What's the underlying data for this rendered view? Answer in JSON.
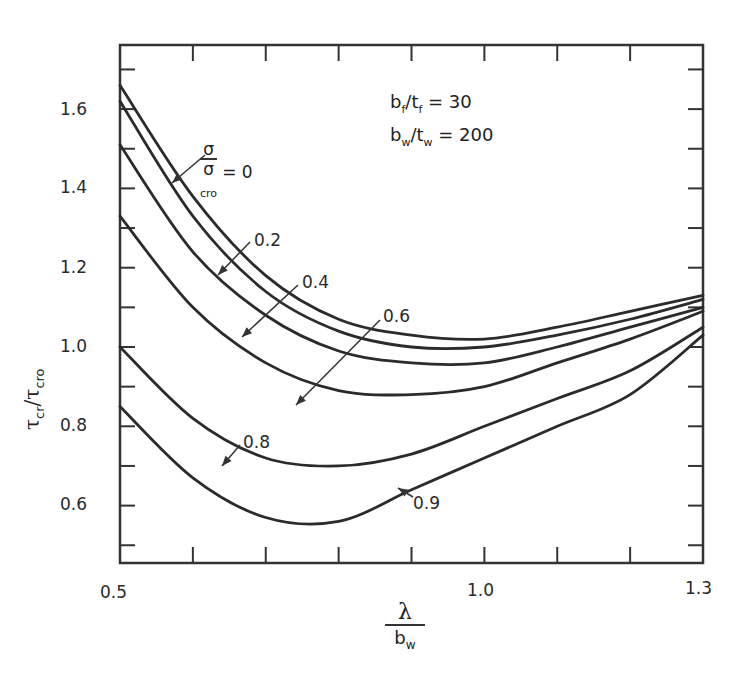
{
  "chart_data": {
    "type": "line",
    "title": "",
    "xlabel": "λ / b_w",
    "ylabel": "τ_cr / τ_cro",
    "xlim": [
      0.5,
      1.3
    ],
    "ylim": [
      0.45,
      1.76
    ],
    "x_ticks": [
      "0.5",
      "1.0",
      "1.3"
    ],
    "y_ticks": [
      "0.6",
      "0.8",
      "1.0",
      "1.2",
      "1.4",
      "1.6"
    ],
    "grid": false,
    "annotations": [
      "b_f/t_f = 30",
      "b_w/t_w = 200"
    ],
    "legend_param": "σ/σ_cro",
    "x": [
      0.5,
      0.6,
      0.7,
      0.8,
      0.9,
      1.0,
      1.1,
      1.2,
      1.3
    ],
    "series": [
      {
        "name": "σ/σcro = 0",
        "values": [
          1.66,
          1.38,
          1.18,
          1.07,
          1.03,
          1.02,
          1.05,
          1.09,
          1.13
        ]
      },
      {
        "name": "σ/σcro = 0.2",
        "values": [
          1.62,
          1.33,
          1.14,
          1.04,
          1.0,
          1.0,
          1.03,
          1.07,
          1.12
        ]
      },
      {
        "name": "σ/σcro = 0.4",
        "values": [
          1.51,
          1.24,
          1.08,
          0.99,
          0.96,
          0.96,
          1.0,
          1.05,
          1.1
        ]
      },
      {
        "name": "σ/σcro = 0.6",
        "values": [
          1.33,
          1.1,
          0.96,
          0.89,
          0.88,
          0.9,
          0.96,
          1.02,
          1.09
        ]
      },
      {
        "name": "σ/σcro = 0.8",
        "values": [
          1.0,
          0.82,
          0.72,
          0.7,
          0.73,
          0.8,
          0.87,
          0.94,
          1.05
        ]
      },
      {
        "name": "σ/σcro = 0.9",
        "values": [
          0.85,
          0.67,
          0.57,
          0.56,
          0.64,
          0.72,
          0.8,
          0.88,
          1.03
        ]
      }
    ]
  },
  "labels": {
    "y_ticks": [
      "1.6",
      "1.4",
      "1.2",
      "1.0",
      "0.8",
      "0.6"
    ],
    "x_ticks": [
      "0.5",
      "1.0",
      "1.3"
    ],
    "ylabel_main": "τ",
    "ylabel_sub1": "cr",
    "ylabel_div": "/τ",
    "ylabel_sub2": "cro",
    "xlabel_num": "λ",
    "xlabel_den": "b",
    "xlabel_den_sub": "w",
    "param1_a": "b",
    "param1_a_sub": "f",
    "param1_b": "/t",
    "param1_b_sub": "f",
    "param1_val": " = 30",
    "param2_a": "b",
    "param2_a_sub": "w",
    "param2_b": "/t",
    "param2_b_sub": "w",
    "param2_val": " = 200",
    "legend_num": "σ",
    "legend_den": "σ",
    "legend_den_sub": "cro",
    "legend_eq": "= 0",
    "curve_02": "0.2",
    "curve_04": "0.4",
    "curve_06": "0.6",
    "curve_08": "0.8",
    "curve_09": "0.9"
  }
}
